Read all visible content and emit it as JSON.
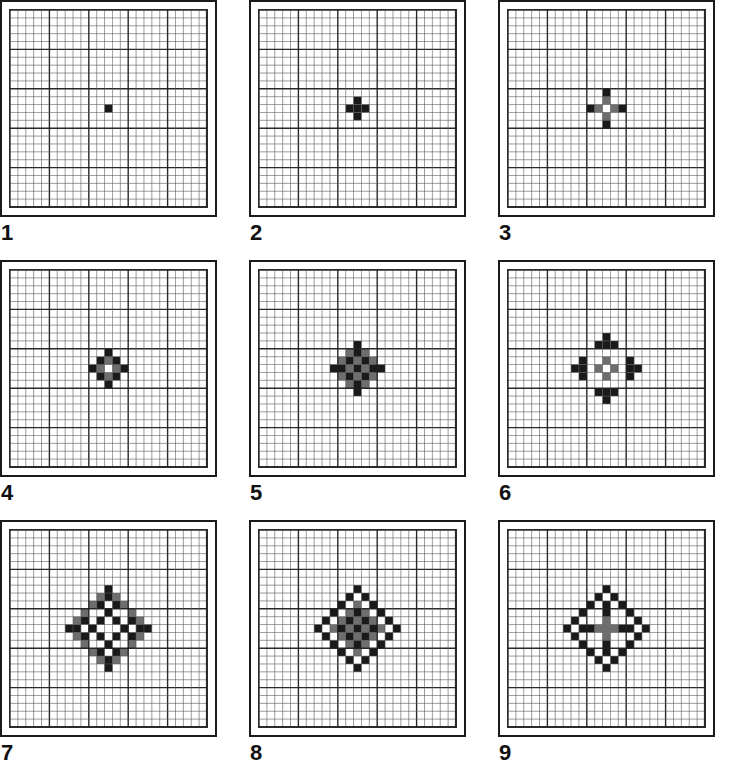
{
  "page": {
    "background_color": "#ffffff",
    "panel_count": 9,
    "columns": 3,
    "rows": 3
  },
  "grid": {
    "cols": 25,
    "rows": 25,
    "cell_size_px": 7.6,
    "minor_line_color": "#555555",
    "major_line_color": "#1f1f1f",
    "major_every": 5,
    "minor_line_width": 0.8,
    "major_line_width": 1.4,
    "frame_color": "#1a1a1a"
  },
  "colors": {
    "fill_black": "#1a1a1a",
    "fill_gray": "#6e6e6e",
    "paper": "#ffffff",
    "label": "#111111"
  },
  "panels": [
    {
      "label": "1",
      "name": "panel-1",
      "description": "single filled cell at centre",
      "black_cells": [
        [
          0,
          0
        ]
      ],
      "gray_cells": []
    },
    {
      "label": "2",
      "name": "panel-2",
      "description": "plus of five cells",
      "black_cells": [
        [
          0,
          0
        ],
        [
          1,
          0
        ],
        [
          -1,
          0
        ],
        [
          0,
          1
        ],
        [
          0,
          -1
        ]
      ],
      "gray_cells": []
    },
    {
      "label": "3",
      "name": "panel-3",
      "description": "plus of radius two with hollow centre",
      "black_cells": [
        [
          0,
          -2
        ],
        [
          0,
          2
        ],
        [
          -2,
          0
        ],
        [
          2,
          0
        ]
      ],
      "gray_cells": [
        [
          0,
          -1
        ],
        [
          0,
          1
        ],
        [
          -1,
          0
        ],
        [
          1,
          0
        ]
      ]
    },
    {
      "label": "4",
      "name": "panel-4",
      "description": "hollow diamond ring of radius two",
      "black_cells": [
        [
          0,
          -2
        ],
        [
          0,
          2
        ],
        [
          -2,
          0
        ],
        [
          2,
          0
        ],
        [
          -1,
          -1
        ],
        [
          1,
          -1
        ],
        [
          -1,
          1
        ],
        [
          1,
          1
        ]
      ],
      "gray_cells": [
        [
          0,
          -1
        ],
        [
          0,
          1
        ],
        [
          -1,
          0
        ],
        [
          1,
          0
        ]
      ]
    },
    {
      "label": "5",
      "name": "panel-5",
      "description": "checkerboard diamond star of radius three",
      "black_cells": [
        [
          0,
          -3
        ],
        [
          0,
          3
        ],
        [
          -3,
          0
        ],
        [
          3,
          0
        ],
        [
          -1,
          -1
        ],
        [
          1,
          -1
        ],
        [
          -1,
          1
        ],
        [
          1,
          1
        ],
        [
          0,
          0
        ],
        [
          -2,
          0
        ],
        [
          2,
          0
        ],
        [
          0,
          -2
        ],
        [
          0,
          2
        ]
      ],
      "gray_cells": [
        [
          0,
          -2
        ],
        [
          0,
          2
        ],
        [
          -2,
          0
        ],
        [
          2,
          0
        ],
        [
          -2,
          -1
        ],
        [
          2,
          -1
        ],
        [
          -2,
          1
        ],
        [
          2,
          1
        ],
        [
          -1,
          -2
        ],
        [
          1,
          -2
        ],
        [
          -1,
          2
        ],
        [
          1,
          2
        ],
        [
          -1,
          0
        ],
        [
          1,
          0
        ],
        [
          0,
          -1
        ],
        [
          0,
          1
        ]
      ]
    },
    {
      "label": "6",
      "name": "panel-6",
      "description": "central ring with four detached clusters",
      "black_cells": [
        [
          0,
          -4
        ],
        [
          0,
          4
        ],
        [
          -4,
          0
        ],
        [
          4,
          0
        ],
        [
          -1,
          -3
        ],
        [
          1,
          -3
        ],
        [
          -1,
          3
        ],
        [
          1,
          3
        ],
        [
          -3,
          -1
        ],
        [
          -3,
          1
        ],
        [
          3,
          -1
        ],
        [
          3,
          1
        ],
        [
          0,
          -3
        ],
        [
          0,
          3
        ],
        [
          -3,
          0
        ],
        [
          3,
          0
        ]
      ],
      "gray_cells": [
        [
          0,
          -1
        ],
        [
          0,
          1
        ],
        [
          -1,
          0
        ],
        [
          1,
          0
        ]
      ]
    },
    {
      "label": "7",
      "name": "panel-7",
      "description": "snowflake of four hollow plus clusters",
      "black_cells": [
        [
          0,
          -5
        ],
        [
          0,
          5
        ],
        [
          -5,
          0
        ],
        [
          5,
          0
        ],
        [
          -1,
          -3
        ],
        [
          1,
          -3
        ],
        [
          -1,
          3
        ],
        [
          1,
          3
        ],
        [
          -3,
          -1
        ],
        [
          -3,
          1
        ],
        [
          3,
          -1
        ],
        [
          3,
          1
        ],
        [
          0,
          -2
        ],
        [
          0,
          2
        ],
        [
          -2,
          0
        ],
        [
          2,
          0
        ],
        [
          -1,
          -1
        ],
        [
          1,
          -1
        ],
        [
          -1,
          1
        ],
        [
          1,
          1
        ],
        [
          -4,
          0
        ],
        [
          4,
          0
        ],
        [
          0,
          -4
        ],
        [
          0,
          4
        ]
      ],
      "gray_cells": [
        [
          -3,
          -2
        ],
        [
          -2,
          -3
        ],
        [
          3,
          -2
        ],
        [
          2,
          -3
        ],
        [
          -3,
          2
        ],
        [
          -2,
          3
        ],
        [
          3,
          2
        ],
        [
          2,
          3
        ],
        [
          -4,
          -1
        ],
        [
          -1,
          -4
        ],
        [
          4,
          -1
        ],
        [
          1,
          -4
        ],
        [
          -4,
          1
        ],
        [
          -1,
          4
        ],
        [
          4,
          1
        ],
        [
          1,
          4
        ]
      ]
    },
    {
      "label": "8",
      "name": "panel-8",
      "description": "large diamond ring with dense inner cluster",
      "black_cells": [
        [
          0,
          -5
        ],
        [
          0,
          5
        ],
        [
          -5,
          0
        ],
        [
          5,
          0
        ],
        [
          -1,
          -4
        ],
        [
          1,
          -4
        ],
        [
          -1,
          4
        ],
        [
          1,
          4
        ],
        [
          -2,
          -3
        ],
        [
          2,
          -3
        ],
        [
          -2,
          3
        ],
        [
          2,
          3
        ],
        [
          -3,
          -2
        ],
        [
          3,
          -2
        ],
        [
          -3,
          2
        ],
        [
          3,
          2
        ],
        [
          -4,
          -1
        ],
        [
          4,
          -1
        ],
        [
          -4,
          1
        ],
        [
          4,
          1
        ],
        [
          0,
          -2
        ],
        [
          0,
          2
        ],
        [
          -2,
          0
        ],
        [
          2,
          0
        ],
        [
          -1,
          -1
        ],
        [
          1,
          -1
        ],
        [
          -1,
          1
        ],
        [
          1,
          1
        ],
        [
          0,
          0
        ]
      ],
      "gray_cells": [
        [
          0,
          -3
        ],
        [
          0,
          3
        ],
        [
          -3,
          0
        ],
        [
          3,
          0
        ],
        [
          0,
          -1
        ],
        [
          0,
          1
        ],
        [
          -1,
          0
        ],
        [
          1,
          0
        ],
        [
          -1,
          -2
        ],
        [
          1,
          -2
        ],
        [
          -1,
          2
        ],
        [
          1,
          2
        ],
        [
          -2,
          -1
        ],
        [
          2,
          -1
        ],
        [
          -2,
          1
        ],
        [
          2,
          1
        ]
      ]
    },
    {
      "label": "9",
      "name": "panel-9",
      "description": "open diamond outline with central cross and axis spurs",
      "black_cells": [
        [
          0,
          -5
        ],
        [
          0,
          5
        ],
        [
          -5,
          0
        ],
        [
          5,
          0
        ],
        [
          -1,
          -4
        ],
        [
          1,
          -4
        ],
        [
          -1,
          4
        ],
        [
          1,
          4
        ],
        [
          -2,
          -3
        ],
        [
          2,
          -3
        ],
        [
          -2,
          3
        ],
        [
          2,
          3
        ],
        [
          -3,
          -2
        ],
        [
          3,
          -2
        ],
        [
          -3,
          2
        ],
        [
          3,
          2
        ],
        [
          -4,
          -1
        ],
        [
          4,
          -1
        ],
        [
          -4,
          1
        ],
        [
          4,
          1
        ],
        [
          0,
          -3
        ],
        [
          0,
          2
        ],
        [
          -3,
          0
        ],
        [
          3,
          0
        ],
        [
          0,
          -2
        ],
        [
          -2,
          0
        ],
        [
          2,
          0
        ],
        [
          0,
          3
        ]
      ],
      "gray_cells": [
        [
          0,
          -1
        ],
        [
          0,
          1
        ],
        [
          -1,
          0
        ],
        [
          1,
          0
        ],
        [
          0,
          0
        ]
      ]
    }
  ]
}
